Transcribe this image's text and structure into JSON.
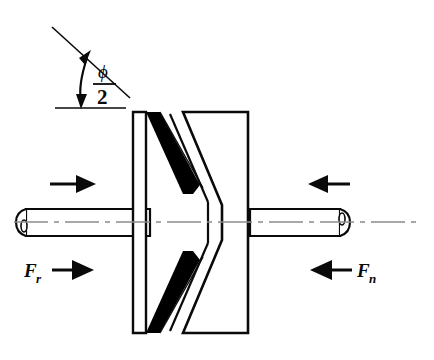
{
  "figure": {
    "background_color": "#ffffff",
    "line_color": "#0a0a0a",
    "fill_black": "#000000",
    "centerline_color": "#8c8c8c",
    "width": 434,
    "height": 360
  },
  "annotations": {
    "angle": {
      "numerator": "ϕ",
      "denominator": "2",
      "name": "half groove angle"
    },
    "force_left": {
      "symbol": "F",
      "subscript": "r",
      "direction": "right"
    },
    "force_right": {
      "symbol": "F",
      "subscript": "n",
      "direction": "left"
    }
  },
  "arrows": {
    "upper_left_label": "",
    "upper_right_label": "",
    "lower_left_label": "",
    "lower_right_label": ""
  }
}
